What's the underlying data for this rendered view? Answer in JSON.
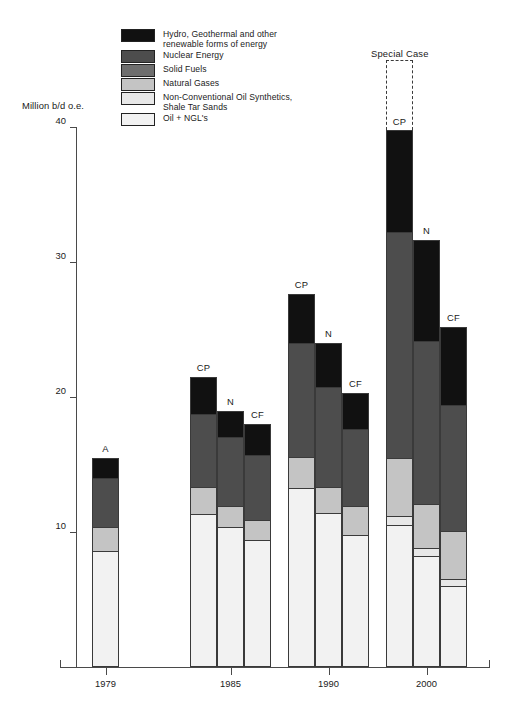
{
  "chart_data": {
    "type": "bar",
    "title": "",
    "ylabel": "Million b/d o.e.",
    "xlabel": "",
    "ylim": [
      0,
      40
    ],
    "yticks": [
      10,
      20,
      30,
      40
    ],
    "grid": false,
    "legend_position": "top-left",
    "stacked": true,
    "annotation": "Special Case",
    "legend": [
      {
        "key": "hydro",
        "label": "Hydro, Geothermal and other\nrenewable forms of energy",
        "color": "#111111"
      },
      {
        "key": "nuclear",
        "label": "Nuclear Energy",
        "color": "#4d4d4d"
      },
      {
        "key": "solid",
        "label": "Solid Fuels",
        "color": "#6e6e6e"
      },
      {
        "key": "gas",
        "label": "Natural Gases",
        "color": "#c4c4c4"
      },
      {
        "key": "nonconv",
        "label": "Non-Conventional Oil Synthetics,\nShale Tar Sands",
        "color": "#e8e8e8"
      },
      {
        "key": "oil",
        "label": "Oil + NGL's",
        "color": "#f2f2f2"
      }
    ],
    "groups": [
      {
        "category": "1979",
        "bars": [
          {
            "scenario": "A",
            "total": 15.5,
            "segments": [
              {
                "key": "oil",
                "value": 8.5
              },
              {
                "key": "nonconv",
                "value": 0.0
              },
              {
                "key": "gas",
                "value": 1.8
              },
              {
                "key": "solid",
                "value": 0.0
              },
              {
                "key": "nuclear",
                "value": 3.7
              },
              {
                "key": "hydro",
                "value": 1.5
              }
            ]
          }
        ]
      },
      {
        "category": "1985",
        "bars": [
          {
            "scenario": "CP",
            "total": 21.5,
            "segments": [
              {
                "key": "oil",
                "value": 11.3
              },
              {
                "key": "nonconv",
                "value": 0.0
              },
              {
                "key": "gas",
                "value": 2.0
              },
              {
                "key": "solid",
                "value": 0.0
              },
              {
                "key": "nuclear",
                "value": 5.4
              },
              {
                "key": "hydro",
                "value": 2.8
              }
            ]
          },
          {
            "scenario": "N",
            "total": 19.0,
            "segments": [
              {
                "key": "oil",
                "value": 10.3
              },
              {
                "key": "nonconv",
                "value": 0.0
              },
              {
                "key": "gas",
                "value": 1.6
              },
              {
                "key": "solid",
                "value": 0.0
              },
              {
                "key": "nuclear",
                "value": 5.1
              },
              {
                "key": "hydro",
                "value": 2.0
              }
            ]
          },
          {
            "scenario": "CF",
            "total": 18.0,
            "segments": [
              {
                "key": "oil",
                "value": 9.3
              },
              {
                "key": "nonconv",
                "value": 0.0
              },
              {
                "key": "gas",
                "value": 1.5
              },
              {
                "key": "solid",
                "value": 0.0
              },
              {
                "key": "nuclear",
                "value": 4.9
              },
              {
                "key": "hydro",
                "value": 2.3
              }
            ]
          }
        ]
      },
      {
        "category": "1990",
        "bars": [
          {
            "scenario": "CP",
            "total": 27.6,
            "segments": [
              {
                "key": "oil",
                "value": 13.2
              },
              {
                "key": "nonconv",
                "value": 0.0
              },
              {
                "key": "gas",
                "value": 2.3
              },
              {
                "key": "solid",
                "value": 0.0
              },
              {
                "key": "nuclear",
                "value": 8.5
              },
              {
                "key": "hydro",
                "value": 3.6
              }
            ]
          },
          {
            "scenario": "N",
            "total": 24.0,
            "segments": [
              {
                "key": "oil",
                "value": 11.3
              },
              {
                "key": "nonconv",
                "value": 0.0
              },
              {
                "key": "gas",
                "value": 2.0
              },
              {
                "key": "solid",
                "value": 0.0
              },
              {
                "key": "nuclear",
                "value": 7.4
              },
              {
                "key": "hydro",
                "value": 3.3
              }
            ]
          },
          {
            "scenario": "CF",
            "total": 20.3,
            "segments": [
              {
                "key": "oil",
                "value": 9.7
              },
              {
                "key": "nonconv",
                "value": 0.0
              },
              {
                "key": "gas",
                "value": 2.2
              },
              {
                "key": "solid",
                "value": 0.0
              },
              {
                "key": "nuclear",
                "value": 5.7
              },
              {
                "key": "hydro",
                "value": 2.7
              }
            ]
          }
        ]
      },
      {
        "category": "2000",
        "bars": [
          {
            "scenario": "CP",
            "total": 39.8,
            "ghost_top": 45.0,
            "segments": [
              {
                "key": "oil",
                "value": 10.4
              },
              {
                "key": "nonconv",
                "value": 0.7
              },
              {
                "key": "gas",
                "value": 4.3
              },
              {
                "key": "solid",
                "value": 0.0
              },
              {
                "key": "nuclear",
                "value": 16.8
              },
              {
                "key": "hydro",
                "value": 7.6
              }
            ]
          },
          {
            "scenario": "N",
            "total": 31.6,
            "segments": [
              {
                "key": "oil",
                "value": 8.1
              },
              {
                "key": "nonconv",
                "value": 0.6
              },
              {
                "key": "gas",
                "value": 3.3
              },
              {
                "key": "solid",
                "value": 0.0
              },
              {
                "key": "nuclear",
                "value": 12.1
              },
              {
                "key": "hydro",
                "value": 7.5
              }
            ]
          },
          {
            "scenario": "CF",
            "total": 25.2,
            "segments": [
              {
                "key": "oil",
                "value": 5.9
              },
              {
                "key": "nonconv",
                "value": 0.5
              },
              {
                "key": "gas",
                "value": 3.6
              },
              {
                "key": "solid",
                "value": 0.0
              },
              {
                "key": "nuclear",
                "value": 9.4
              },
              {
                "key": "hydro",
                "value": 5.8
              }
            ]
          }
        ]
      }
    ]
  }
}
